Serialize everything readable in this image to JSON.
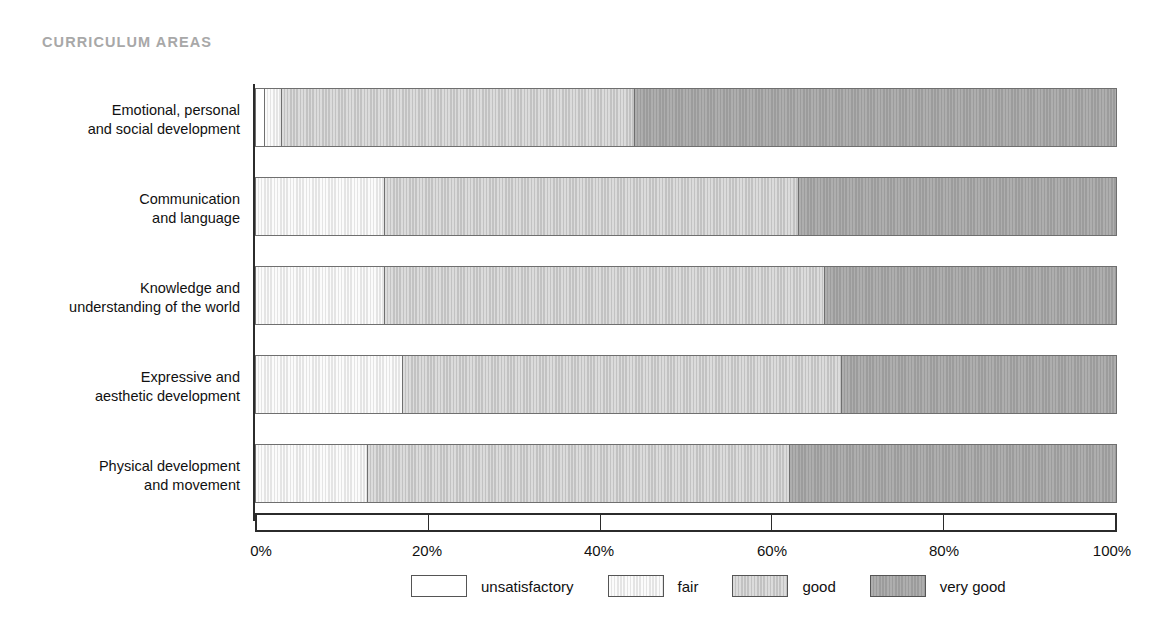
{
  "title": "CURRICULUM AREAS",
  "title_color": "#a8a8a8",
  "chart_data": {
    "type": "bar",
    "subtype": "horizontal-stacked-100",
    "title": "CURRICULUM AREAS",
    "xlabel": "",
    "ylabel": "",
    "xlim": [
      0,
      100
    ],
    "grid": false,
    "legend_position": "bottom",
    "x_tick_labels": [
      "0%",
      "20%",
      "40%",
      "60%",
      "80%",
      "100%"
    ],
    "x_ticks": [
      0,
      20,
      40,
      60,
      80,
      100
    ],
    "categories": [
      "Emotional, personal\nand social development",
      "Communication\nand language",
      "Knowledge and\nunderstanding of the world",
      "Expressive and\naesthetic development",
      "Physical development\nand movement"
    ],
    "series": [
      {
        "name": "unsatisfactory",
        "color": "#ffffff",
        "values": [
          1,
          0,
          0,
          0,
          0
        ]
      },
      {
        "name": "fair",
        "color": "#e4e4e4",
        "values": [
          2,
          15,
          15,
          17,
          13
        ]
      },
      {
        "name": "good",
        "color": "#c2c2c2",
        "values": [
          41,
          48,
          51,
          51,
          49
        ]
      },
      {
        "name": "very good",
        "color": "#9c9c9c",
        "values": [
          56,
          37,
          34,
          32,
          38
        ]
      }
    ]
  },
  "rows": [
    {
      "label_line1": "Emotional, personal",
      "label_line2": "and social development",
      "segments": [
        {
          "key": "unsatisfactory",
          "value": 1
        },
        {
          "key": "fair",
          "value": 2
        },
        {
          "key": "good",
          "value": 41
        },
        {
          "key": "very-good",
          "value": 56
        }
      ]
    },
    {
      "label_line1": "Communication",
      "label_line2": "and language",
      "segments": [
        {
          "key": "fair",
          "value": 15
        },
        {
          "key": "good",
          "value": 48
        },
        {
          "key": "very-good",
          "value": 37
        }
      ]
    },
    {
      "label_line1": "Knowledge and",
      "label_line2": "understanding of the world",
      "segments": [
        {
          "key": "fair",
          "value": 15
        },
        {
          "key": "good",
          "value": 51
        },
        {
          "key": "very-good",
          "value": 34
        }
      ]
    },
    {
      "label_line1": "Expressive and",
      "label_line2": "aesthetic development",
      "segments": [
        {
          "key": "fair",
          "value": 17
        },
        {
          "key": "good",
          "value": 51
        },
        {
          "key": "very-good",
          "value": 32
        }
      ]
    },
    {
      "label_line1": "Physical development",
      "label_line2": "and movement",
      "segments": [
        {
          "key": "fair",
          "value": 13
        },
        {
          "key": "good",
          "value": 49
        },
        {
          "key": "very-good",
          "value": 38
        }
      ]
    }
  ],
  "x_axis": {
    "ticks": [
      {
        "label": "0%",
        "value": 0
      },
      {
        "label": "20%",
        "value": 20
      },
      {
        "label": "40%",
        "value": 40
      },
      {
        "label": "60%",
        "value": 60
      },
      {
        "label": "80%",
        "value": 80
      },
      {
        "label": "100%",
        "value": 100
      }
    ]
  },
  "legend": {
    "items": [
      {
        "label": "unsatisfactory",
        "key": "unsatisfactory",
        "color": "#ffffff"
      },
      {
        "label": "fair",
        "key": "fair",
        "color": "#e4e4e4"
      },
      {
        "label": "good",
        "key": "good",
        "color": "#c2c2c2"
      },
      {
        "label": "very good",
        "key": "very-good",
        "color": "#9c9c9c"
      }
    ]
  },
  "geometry": {
    "axis_left_px": 255,
    "axis_width_px": 862,
    "bar_tops_px": [
      88,
      177,
      266,
      355,
      444
    ],
    "bar_height_px": 59
  }
}
